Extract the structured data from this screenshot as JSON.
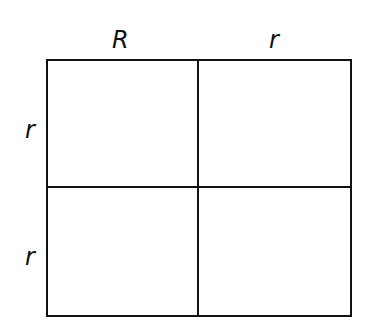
{
  "punnett_square": {
    "top_alleles": [
      "R",
      "r"
    ],
    "left_alleles": [
      "r",
      "r"
    ],
    "cells": [
      "",
      "",
      "",
      ""
    ]
  }
}
